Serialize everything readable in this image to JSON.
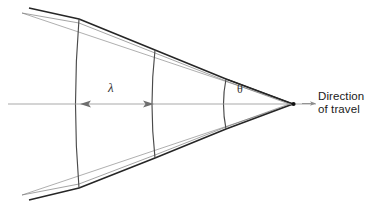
{
  "figure": {
    "background_color": "#ffffff",
    "line_color": "#2b2b2b",
    "thin_line_color": "#8a8a8a",
    "axis_color": "#9a9a9a",
    "width": 387,
    "height": 208
  },
  "labels": {
    "wavelength_symbol": "λ",
    "angle_symbol": "θ",
    "direction_line1": "Direction",
    "direction_line2": "of travel"
  },
  "geometry": {
    "apex": {
      "x": 293,
      "y": 104
    },
    "axis": {
      "x1": 8,
      "y1": 104,
      "x2": 316,
      "y2": 104
    },
    "wavefronts": [
      {
        "name": "wavefront-1",
        "x_axis_crossing": 79,
        "top_y": 19,
        "bottom_y": 188,
        "bulge": 5
      },
      {
        "name": "wavefront-2",
        "x_axis_crossing": 155,
        "top_y": 50,
        "bottom_y": 158,
        "bulge": 4
      },
      {
        "name": "wavefront-3",
        "x_axis_crossing": 226,
        "top_y": 79,
        "bottom_y": 129,
        "bulge": 3
      }
    ],
    "wavelength_span": {
      "from_x": 79,
      "to_x": 155,
      "y": 104
    },
    "cone_half_angle_deg": 19
  },
  "icons": {
    "source_point": "dot-icon",
    "travel_arrow": "arrow-right-icon",
    "lambda_arrow_left": "arrow-left-icon",
    "lambda_arrow_right": "arrow-right-icon"
  }
}
